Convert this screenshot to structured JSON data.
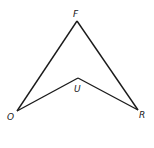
{
  "figure": {
    "type": "concave quadrilateral (dart/arrowhead)",
    "vertices": [
      {
        "id": "F",
        "label": "F"
      },
      {
        "id": "O",
        "label": "O"
      },
      {
        "id": "U",
        "label": "U"
      },
      {
        "id": "R",
        "label": "R"
      }
    ],
    "edges": [
      [
        "F",
        "O"
      ],
      [
        "O",
        "U"
      ],
      [
        "U",
        "R"
      ],
      [
        "R",
        "F"
      ]
    ],
    "stroke_color": "#1a1a1a",
    "label_color": "#222222"
  }
}
